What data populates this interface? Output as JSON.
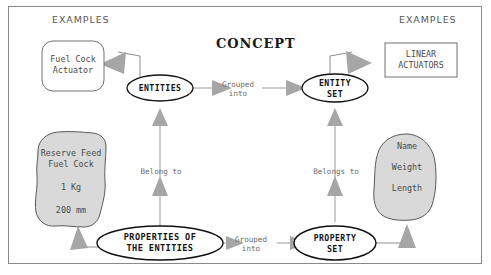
{
  "diagram": {
    "title": "CONCEPT",
    "frame_color": "#8a8a8a",
    "background": "#ffffff",
    "blob_fill": "#d9d9d9",
    "arrow_fill": "#a6a6a6",
    "connector_color": "#8f8f8f",
    "headers": {
      "examples_left": "EXAMPLES",
      "examples_right": "EXAMPLES"
    },
    "nodes": {
      "fuel_cock_actuator": "Fuel Cock\nActuator",
      "entities": "ENTITIES",
      "entity_set": "ENTITY\nSET",
      "linear_actuators": "LINEAR\nACTUATORS",
      "reserve_feed_blob": "Reserve Feed\nFuel Cock\n\n1 Kg\n\n200 mm",
      "properties_of_the_entities": "PROPERTIES OF\nTHE ENTITIES",
      "property_set": "PROPERTY\nSET",
      "attributes_blob": "Name\n\nWeight\n\nLength"
    },
    "edges": {
      "grouped_into_top": "Grouped\ninto",
      "grouped_into_bottom": "Grouped\ninto",
      "belong_to": "Belong to",
      "belongs_to": "Belongs to"
    }
  }
}
